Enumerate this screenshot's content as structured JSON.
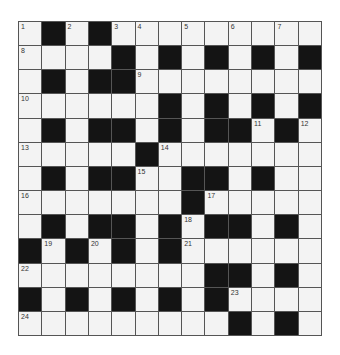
{
  "puzzle": {
    "rows": 13,
    "cols": 13,
    "colors": {
      "black_cell": "#141414",
      "white_cell": "#f3f3f3",
      "grid_line": "#555555",
      "number_text": "#333333"
    },
    "grid": [
      ".#.#.........",
      "....#.#.#.#.#",
      ".#.##........",
      "......#.#.#.#",
      ".#.##.#.##.#.",
      ".....#.......",
      ".#.##..##.#.",
      ".......#.....",
      ".#.##.#.##.#.",
      "#.#.#.#......",
      "........##.#.",
      "#.#.#.#.#....",
      ".........#.#."
    ],
    "numbers": [
      {
        "row": 0,
        "col": 0,
        "n": "1"
      },
      {
        "row": 0,
        "col": 2,
        "n": "2"
      },
      {
        "row": 0,
        "col": 4,
        "n": "3"
      },
      {
        "row": 0,
        "col": 5,
        "n": "4"
      },
      {
        "row": 0,
        "col": 7,
        "n": "5"
      },
      {
        "row": 0,
        "col": 9,
        "n": "6"
      },
      {
        "row": 0,
        "col": 11,
        "n": "7"
      },
      {
        "row": 1,
        "col": 0,
        "n": "8"
      },
      {
        "row": 2,
        "col": 5,
        "n": "9"
      },
      {
        "row": 3,
        "col": 0,
        "n": "10"
      },
      {
        "row": 4,
        "col": 10,
        "n": "11"
      },
      {
        "row": 4,
        "col": 12,
        "n": "12"
      },
      {
        "row": 5,
        "col": 0,
        "n": "13"
      },
      {
        "row": 5,
        "col": 6,
        "n": "14"
      },
      {
        "row": 6,
        "col": 5,
        "n": "15"
      },
      {
        "row": 7,
        "col": 0,
        "n": "16"
      },
      {
        "row": 7,
        "col": 8,
        "n": "17"
      },
      {
        "row": 8,
        "col": 7,
        "n": "18"
      },
      {
        "row": 9,
        "col": 1,
        "n": "19"
      },
      {
        "row": 9,
        "col": 3,
        "n": "20"
      },
      {
        "row": 9,
        "col": 7,
        "n": "21"
      },
      {
        "row": 10,
        "col": 0,
        "n": "22"
      },
      {
        "row": 11,
        "col": 9,
        "n": "23"
      },
      {
        "row": 12,
        "col": 0,
        "n": "24"
      }
    ]
  }
}
